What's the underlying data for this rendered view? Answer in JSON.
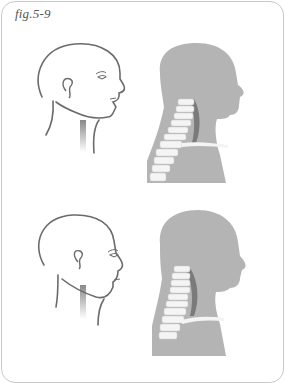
{
  "figure": {
    "label": "fig.5-9",
    "colors": {
      "background": "#ffffff",
      "border": "#c8c8c8",
      "line_drawing": "#6b6b6b",
      "silhouette": "#b4b4b4",
      "spine": "#f4f4f4",
      "muscle": "#7a7a7a"
    },
    "rows": [
      {
        "name": "top-row",
        "panels": [
          {
            "name": "head-outline-upright",
            "description": "Line drawing of head in profile, chin raised"
          },
          {
            "name": "head-silhouette-spine-upright",
            "description": "Gray silhouette with cervical spine shown"
          }
        ]
      },
      {
        "name": "bottom-row",
        "panels": [
          {
            "name": "head-outline-forward",
            "description": "Line drawing of head in profile, chin lowered"
          },
          {
            "name": "head-silhouette-spine-forward",
            "description": "Gray silhouette with cervical spine shown, forward posture"
          }
        ]
      }
    ]
  }
}
